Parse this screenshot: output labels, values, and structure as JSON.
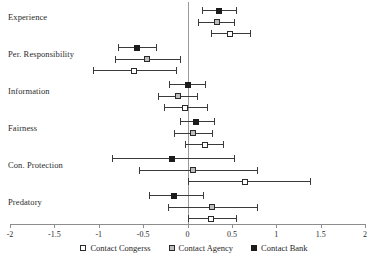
{
  "chart_data": {
    "type": "scatter",
    "subtype": "coefficient-plot-with-error-bars",
    "title": "",
    "xlabel": "",
    "ylabel": "",
    "xlim": [
      -2,
      2
    ],
    "xticks": [
      -2,
      -1.5,
      -1,
      -0.5,
      0,
      0.5,
      1,
      1.5,
      2
    ],
    "xticklabels": [
      "-2",
      "-1.5",
      "-1",
      "-0.5",
      "0",
      "0.5",
      "1",
      "1.5",
      "2"
    ],
    "grid": false,
    "zero_reference_line": 0,
    "legend_position": "bottom-center",
    "categories": [
      "Experience",
      "Per. Responsibility",
      "Information",
      "Fairness",
      "Con. Protection",
      "Predatory"
    ],
    "series": [
      {
        "name": "Contact Bank",
        "marker": "filled-square",
        "color": "#1c1c1c",
        "points": [
          {
            "category": "Experience",
            "estimate": 0.36,
            "ci_low": 0.16,
            "ci_high": 0.55
          },
          {
            "category": "Per. Responsibility",
            "estimate": -0.57,
            "ci_low": -0.78,
            "ci_high": -0.36
          },
          {
            "category": "Information",
            "estimate": 0.0,
            "ci_low": -0.21,
            "ci_high": 0.2
          },
          {
            "category": "Fairness",
            "estimate": 0.1,
            "ci_low": -0.09,
            "ci_high": 0.3
          },
          {
            "category": "Con. Protection",
            "estimate": -0.18,
            "ci_low": -0.85,
            "ci_high": 0.52
          },
          {
            "category": "Predatory",
            "estimate": -0.15,
            "ci_low": -0.43,
            "ci_high": 0.17
          }
        ]
      },
      {
        "name": "Contact Agency",
        "marker": "grey-square",
        "color": "#bdbdbd",
        "points": [
          {
            "category": "Experience",
            "estimate": 0.33,
            "ci_low": 0.12,
            "ci_high": 0.52
          },
          {
            "category": "Per. Responsibility",
            "estimate": -0.46,
            "ci_low": -0.82,
            "ci_high": -0.08
          },
          {
            "category": "Information",
            "estimate": -0.11,
            "ci_low": -0.33,
            "ci_high": 0.11
          },
          {
            "category": "Fairness",
            "estimate": 0.06,
            "ci_low": -0.15,
            "ci_high": 0.28
          },
          {
            "category": "Con. Protection",
            "estimate": 0.06,
            "ci_low": -0.55,
            "ci_high": 0.78
          },
          {
            "category": "Predatory",
            "estimate": 0.28,
            "ci_low": -0.22,
            "ci_high": 0.78
          }
        ]
      },
      {
        "name": "Contact Congerss",
        "marker": "open-square",
        "color": "#ffffff",
        "points": [
          {
            "category": "Experience",
            "estimate": 0.48,
            "ci_low": 0.27,
            "ci_high": 0.7
          },
          {
            "category": "Per. Responsibility",
            "estimate": -0.6,
            "ci_low": -1.06,
            "ci_high": -0.13
          },
          {
            "category": "Information",
            "estimate": -0.03,
            "ci_low": -0.26,
            "ci_high": 0.22
          },
          {
            "category": "Fairness",
            "estimate": 0.2,
            "ci_low": -0.03,
            "ci_high": 0.4
          },
          {
            "category": "Con. Protection",
            "estimate": 0.65,
            "ci_low": 0.0,
            "ci_high": 1.38
          },
          {
            "category": "Predatory",
            "estimate": 0.27,
            "ci_low": 0.0,
            "ci_high": 0.55
          }
        ]
      }
    ]
  },
  "legend": {
    "items": [
      {
        "label": "Contact Congerss",
        "marker": "open-square"
      },
      {
        "label": "Contact Agency",
        "marker": "grey-square"
      },
      {
        "label": "Contact Bank",
        "marker": "filled-square"
      }
    ]
  }
}
